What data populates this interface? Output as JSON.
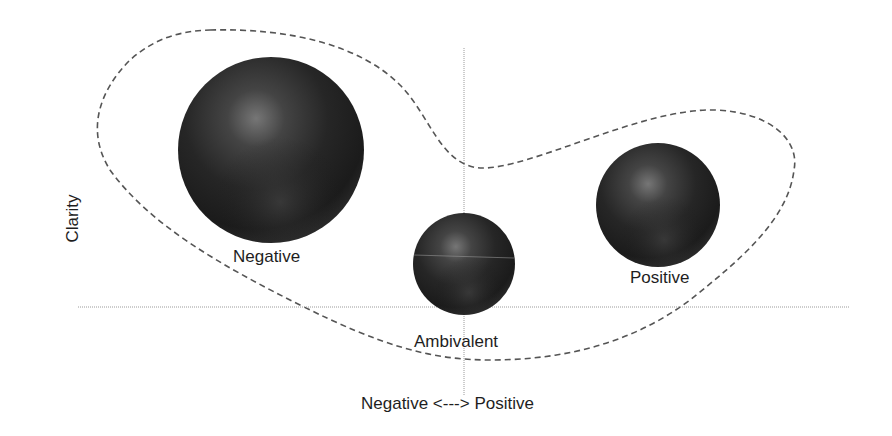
{
  "diagram": {
    "y_axis_label": "Clarity",
    "x_axis_label": "Negative <---> Positive",
    "axes": {
      "horizontal": {
        "x1": 78,
        "x2": 850,
        "y": 307
      },
      "vertical": {
        "x": 464,
        "y1": 48,
        "y2": 396
      }
    },
    "spheres": [
      {
        "label": "Negative",
        "cx": 271,
        "cy": 150,
        "r": 93,
        "label_x": 233,
        "label_y": 248
      },
      {
        "label": "Ambivalent",
        "cx": 464,
        "cy": 264,
        "r": 51,
        "label_x": 414,
        "label_y": 333
      },
      {
        "label": "Positive",
        "cx": 658,
        "cy": 205,
        "r": 62,
        "label_x": 630,
        "label_y": 269
      }
    ],
    "enclosure": {
      "style": "dashed",
      "color": "#555555"
    },
    "colors": {
      "sphere_dark": "#1c1c1c",
      "sphere_highlight": "#7a7a7a",
      "axis": "#9a9a9a"
    }
  }
}
